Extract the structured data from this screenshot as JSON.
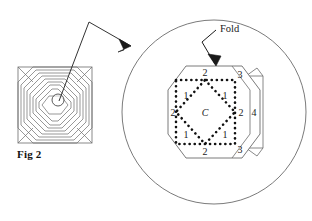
{
  "figure": {
    "caption": "Fig 2",
    "fold_label": "Fold",
    "center_label": "C",
    "region_labels": {
      "top_2": "2",
      "bottom_2": "2",
      "left_2": "2",
      "right_2": "2",
      "top_right_3": "3",
      "bottom_right_3": "3",
      "flap_4": "4",
      "inner_top_left_1": "1",
      "inner_top_right_1": "1",
      "inner_bottom_left_1": "1",
      "inner_bottom_right_1": "1"
    },
    "colors": {
      "line": "#6b6b6b",
      "dotted_crease": "#111111",
      "text": "#1a1a1a",
      "background": "#ffffff"
    },
    "parts": {
      "small_figure_name": "concentric octagon square pattern",
      "magnifier_name": "magnified detail circle",
      "pointer_name": "magnifier leader line"
    }
  }
}
